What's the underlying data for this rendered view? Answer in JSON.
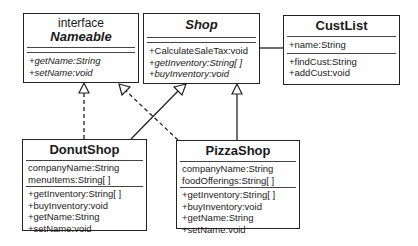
{
  "classes": {
    "nameable": {
      "stereotype": "interface",
      "name": "Nameable",
      "attributes": [],
      "methods": [
        "+getName:String",
        "+setName:void"
      ]
    },
    "shop": {
      "name": "Shop",
      "attributes": [],
      "methods": [
        "+CalculateSaleTax:void",
        "+getInventory:String[ ]",
        "+buyInventory:void"
      ]
    },
    "custlist": {
      "name": "CustList",
      "attributes": [
        "+name:String"
      ],
      "methods": [
        "+findCust:String",
        "+addCust:void"
      ]
    },
    "donutshop": {
      "name": "DonutShop",
      "attributes": [
        "companyName:String",
        "menuItems:String[ ]"
      ],
      "methods": [
        "+getInventory:String[ ]",
        "+buyInventory:void",
        "+getName:String",
        "+setName:void"
      ]
    },
    "pizzashop": {
      "name": "PizzaShop",
      "attributes": [
        "companyName:String",
        "foodOfferings:String[ ]"
      ],
      "methods": [
        "+getInventory:String[ ]",
        "+buyInventory:void",
        "+getName:String",
        "+setName:void"
      ]
    }
  },
  "relations": [
    {
      "from": "DonutShop",
      "to": "Nameable",
      "type": "realization"
    },
    {
      "from": "PizzaShop",
      "to": "Nameable",
      "type": "realization"
    },
    {
      "from": "DonutShop",
      "to": "Shop",
      "type": "generalization"
    },
    {
      "from": "PizzaShop",
      "to": "Shop",
      "type": "generalization"
    },
    {
      "from": "Shop",
      "to": "CustList",
      "type": "association"
    }
  ],
  "colors": {
    "line": "#222222",
    "background": "#ffffff"
  }
}
